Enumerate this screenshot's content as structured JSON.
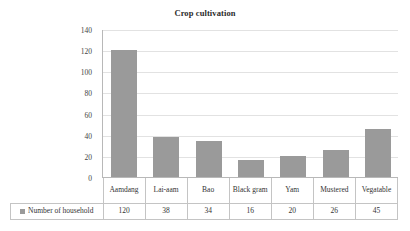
{
  "chart_data": {
    "type": "bar",
    "title": "Crop cultivation",
    "xlabel": "",
    "ylabel": "",
    "categories": [
      "Aamdang",
      "Lai-aam",
      "Bao",
      "Black gram",
      "Yam",
      "Mustered",
      "Vegatable"
    ],
    "values": [
      120,
      38,
      34,
      16,
      20,
      26,
      45
    ],
    "series": [
      {
        "name": "Number of household",
        "values": [
          120,
          38,
          34,
          16,
          20,
          26,
          45
        ]
      }
    ],
    "ylim": [
      0,
      140
    ],
    "y_ticks": [
      0,
      20,
      40,
      60,
      80,
      100,
      120,
      140
    ],
    "y_tick_labels": [
      "0",
      "20",
      "40",
      "60",
      "80",
      "100",
      "120",
      "140"
    ],
    "grid": true,
    "legend_position": "data-table-left",
    "bar_color": "#9a9a9a",
    "gridline_color": "#e2e2e2",
    "axis_color": "#b8b8b8"
  },
  "legend": {
    "series_label": "Number of household",
    "marker_icon": "square-marker-icon",
    "marker_color": "#9a9a9a"
  },
  "data_table": {
    "row_label": "Number of household",
    "category_labels": [
      "Aamdang",
      "Lai-aam",
      "Bao",
      "Black gram",
      "Yam",
      "Mustered",
      "Vegatable"
    ],
    "value_labels": [
      "120",
      "38",
      "34",
      "16",
      "20",
      "26",
      "45"
    ]
  }
}
